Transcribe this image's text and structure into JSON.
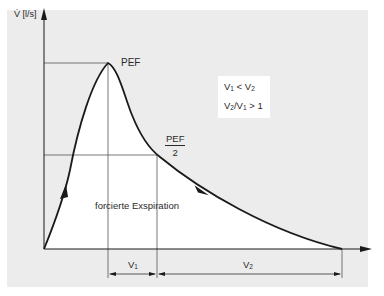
{
  "diagram": {
    "y_axis_label": "V̇ [l/s]",
    "peak_label": "PEF",
    "half_peak_label": {
      "numerator": "PEF",
      "denominator": "2"
    },
    "curve_label": "forcierte Exspiration",
    "volume_labels": {
      "v1": {
        "base": "V",
        "sub": "1"
      },
      "v2": {
        "base": "V",
        "sub": "2"
      }
    },
    "note": {
      "line1": {
        "a": "V",
        "a_sub": "1",
        "op": " < ",
        "b": "V",
        "b_sub": "2"
      },
      "line2": {
        "a": "V",
        "a_sub": "2",
        "sep": "/",
        "b": "V",
        "b_sub": "1",
        "op": " > 1"
      }
    },
    "colors": {
      "panel": "#ececec",
      "area": "#ffffff",
      "line": "#1a1a1a",
      "guide": "#555555"
    }
  }
}
